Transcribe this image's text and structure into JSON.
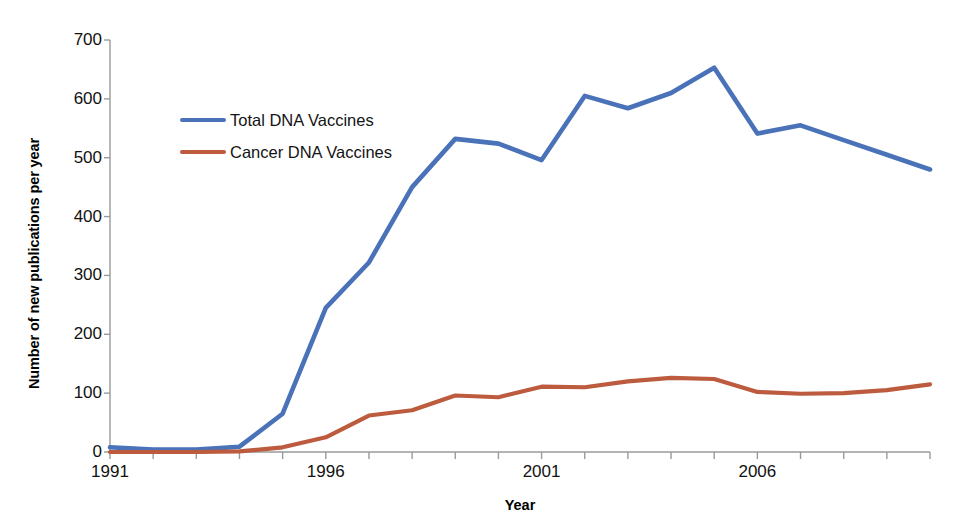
{
  "chart_data": {
    "type": "line",
    "title": "",
    "xlabel": "Year",
    "ylabel": "Number of new publications per year",
    "xlim": [
      1991,
      2010
    ],
    "ylim": [
      0,
      700
    ],
    "ytick_values": [
      0,
      100,
      200,
      300,
      400,
      500,
      600,
      700
    ],
    "ytick_labels": [
      "0",
      "100",
      "200",
      "300",
      "400",
      "500",
      "600",
      "700"
    ],
    "xtick_values": [
      1991,
      1992,
      1993,
      1994,
      1995,
      1996,
      1997,
      1998,
      1999,
      2000,
      2001,
      2002,
      2003,
      2004,
      2005,
      2006,
      2007,
      2008,
      2009,
      2010
    ],
    "xtick_labels_shown": [
      "1991",
      "1996",
      "2001",
      "2006"
    ],
    "xtick_labels_shown_values": [
      1991,
      1996,
      2001,
      2006
    ],
    "grid": false,
    "legend_position": "upper-left-inside",
    "x": [
      1991,
      1992,
      1993,
      1994,
      1995,
      1996,
      1997,
      1998,
      1999,
      2000,
      2001,
      2002,
      2003,
      2004,
      2005,
      2006,
      2007,
      2008,
      2009,
      2010
    ],
    "series": [
      {
        "name": "Total DNA Vaccines",
        "color": "#4A72B8",
        "values": [
          8,
          4,
          4,
          9,
          65,
          245,
          322,
          450,
          532,
          524,
          496,
          605,
          584,
          610,
          653,
          541,
          555,
          530,
          505,
          480
        ]
      },
      {
        "name": "Cancer DNA Vaccines",
        "color": "#BC5B3E",
        "values": [
          0,
          0,
          0,
          1,
          8,
          25,
          62,
          71,
          96,
          93,
          111,
          110,
          120,
          126,
          124,
          102,
          99,
          100,
          105,
          115
        ]
      }
    ]
  },
  "axes": {
    "y_title": "Number of new publications per year",
    "x_title": "Year"
  },
  "legend": {
    "items": [
      {
        "label": "Total DNA Vaccines",
        "color": "#4A72B8"
      },
      {
        "label": "Cancer DNA Vaccines",
        "color": "#BC5B3E"
      }
    ]
  }
}
